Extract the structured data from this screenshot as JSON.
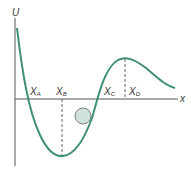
{
  "diagram": {
    "y_axis_label": "U",
    "x_axis_label": "x",
    "points": [
      {
        "label": "X",
        "sub": "A"
      },
      {
        "label": "X",
        "sub": "B"
      },
      {
        "label": "X",
        "sub": "C"
      },
      {
        "label": "X",
        "sub": "D"
      }
    ],
    "colors": {
      "curve": "#3f8f74",
      "axis": "#555555",
      "dashed": "#666666",
      "ball_fill": "#cfe3dc",
      "ball_stroke": "#666666"
    }
  }
}
